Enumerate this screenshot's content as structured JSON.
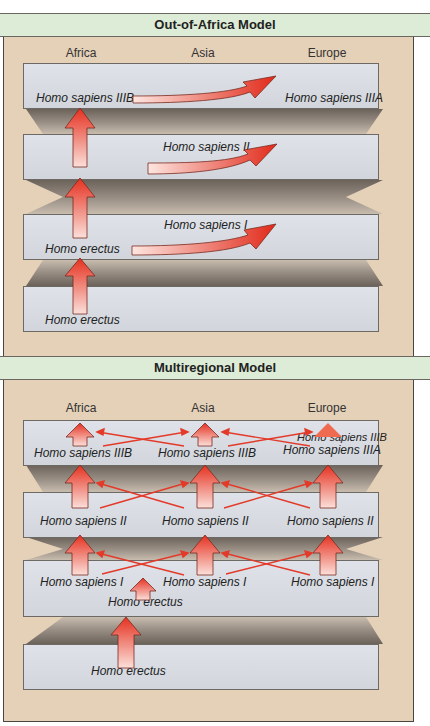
{
  "colors": {
    "background": "#e5d0b8",
    "title_bar": "#dcecd6",
    "slab": "#d8dbe1",
    "arrow": "#e8412f",
    "border": "#4a4540"
  },
  "out_of_africa": {
    "title": "Out-of-Africa Model",
    "regions": [
      "Africa",
      "Asia",
      "Europe"
    ],
    "layers": [
      {
        "labels": {
          "africa": "Homo sapiens IIIB",
          "europe": "Homo sapiens IIIA"
        }
      },
      {
        "labels": {
          "asia": "Homo sapiens II"
        }
      },
      {
        "labels": {
          "africa": "Homo erectus",
          "asia": "Homo sapiens I"
        }
      },
      {
        "labels": {
          "africa": "Homo erectus"
        }
      }
    ]
  },
  "multiregional": {
    "title": "Multiregional Model",
    "regions": [
      "Africa",
      "Asia",
      "Europe"
    ],
    "layers": [
      {
        "labels": {
          "africa": "Homo sapiens IIIB",
          "asia": "Homo sapiens IIIB",
          "europe_top": "Homo sapiens IIIB",
          "europe": "Homo sapiens IIIA"
        }
      },
      {
        "labels": {
          "africa": "Homo sapiens II",
          "asia": "Homo sapiens II",
          "europe": "Homo sapiens II"
        }
      },
      {
        "labels": {
          "africa": "Homo sapiens I",
          "asia": "Homo sapiens I",
          "europe": "Homo sapiens I",
          "center": "Homo erectus"
        }
      },
      {
        "labels": {
          "center": "Homo erectus"
        }
      }
    ]
  }
}
